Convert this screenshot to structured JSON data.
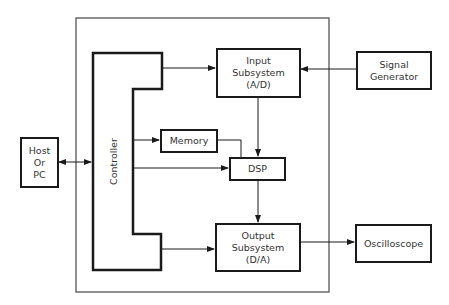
{
  "diagram": {
    "type": "block-diagram",
    "enclosure": {
      "label": ""
    },
    "blocks": {
      "host": {
        "lines": [
          "Host",
          "Or",
          "PC"
        ]
      },
      "controller": {
        "label": "Controller"
      },
      "memory": {
        "label": "Memory"
      },
      "dsp": {
        "label": "DSP"
      },
      "input": {
        "lines": [
          "Input",
          "Subsystem",
          "(A/D)"
        ]
      },
      "output": {
        "lines": [
          "Output",
          "Subsystem",
          "(D/A)"
        ]
      },
      "signal_generator": {
        "lines": [
          "Signal",
          "Generator"
        ]
      },
      "oscilloscope": {
        "label": "Oscilloscope"
      }
    },
    "connections": [
      {
        "from": "Host Or PC",
        "to": "Controller",
        "bidirectional": true
      },
      {
        "from": "Controller",
        "to": "Input Subsystem (A/D)"
      },
      {
        "from": "Signal Generator",
        "to": "Input Subsystem (A/D)"
      },
      {
        "from": "Controller",
        "to": "Memory"
      },
      {
        "from": "Memory",
        "to": "DSP"
      },
      {
        "from": "Controller",
        "to": "DSP"
      },
      {
        "from": "Input Subsystem (A/D)",
        "to": "DSP"
      },
      {
        "from": "DSP",
        "to": "Output Subsystem (D/A)"
      },
      {
        "from": "Controller",
        "to": "Output Subsystem (D/A)"
      },
      {
        "from": "Output Subsystem (D/A)",
        "to": "Oscilloscope"
      }
    ]
  }
}
